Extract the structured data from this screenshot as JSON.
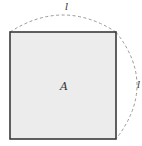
{
  "diagram": {
    "square": {
      "label": "A",
      "fill": "#ececec",
      "stroke": "#3a3a3a"
    },
    "arcs": [
      {
        "position": "top",
        "label": "l",
        "style": "dashed",
        "stroke": "#9a9a9a"
      },
      {
        "position": "right",
        "label": "l",
        "style": "dashed",
        "stroke": "#9a9a9a"
      }
    ],
    "background": "#ffffff"
  }
}
